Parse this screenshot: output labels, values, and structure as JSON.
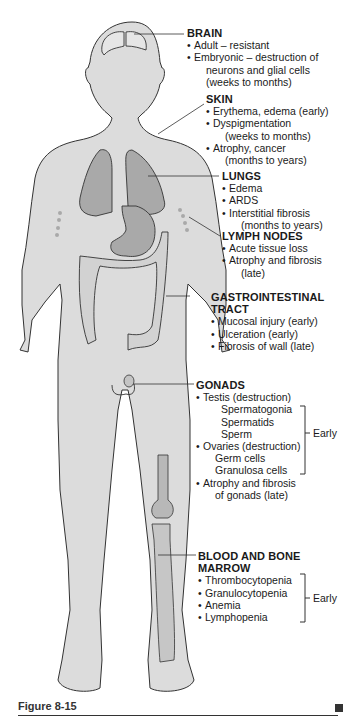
{
  "figure": {
    "caption": "Figure 8-15",
    "colors": {
      "body_fill": "#dcdcdc",
      "organ_fill": "#a9a9a9",
      "outline": "#333333",
      "text": "#1a1a1a"
    }
  },
  "labels": {
    "brain": {
      "title": "BRAIN",
      "items": [
        {
          "text": "Adult – resistant"
        },
        {
          "text": "Embryonic – destruction of",
          "cont": [
            "neurons and glial cells",
            "(weeks to months)"
          ]
        }
      ]
    },
    "skin": {
      "title": "SKIN",
      "items": [
        {
          "text": "Erythema, edema (early)"
        },
        {
          "text": "Dyspigmentation",
          "cont": [
            "(weeks to months)"
          ]
        },
        {
          "text": "Atrophy, cancer",
          "cont": [
            "(months to years)"
          ]
        }
      ]
    },
    "lungs": {
      "title": "LUNGS",
      "items": [
        {
          "text": "Edema"
        },
        {
          "text": "ARDS"
        },
        {
          "text": "Interstitial fibrosis",
          "cont": [
            "(months to years)"
          ]
        }
      ]
    },
    "lymph_nodes": {
      "title": "LYMPH NODES",
      "items": [
        {
          "text": "Acute tissue loss"
        },
        {
          "text": "Atrophy and fibrosis",
          "cont": [
            "(late)"
          ]
        }
      ]
    },
    "gi_tract": {
      "title_line1": "GASTROINTESTINAL",
      "title_line2": "TRACT",
      "items": [
        {
          "text": "Mucosal injury (early)"
        },
        {
          "text": "Ulceration (early)"
        },
        {
          "text": "Fibrosis of wall (late)"
        }
      ]
    },
    "gonads": {
      "title": "GONADS",
      "testis": "Testis (destruction)",
      "testis_sub": [
        "Spermatogonia",
        "Spermatids",
        "Sperm"
      ],
      "ovaries": "Ovaries (destruction)",
      "ovaries_sub": [
        "Germ cells",
        "Granulosa cells"
      ],
      "late": "Atrophy and fibrosis",
      "late_cont": "of gonads (late)",
      "bracket_label": "Early"
    },
    "blood_marrow": {
      "title_line1": "BLOOD AND BONE",
      "title_line2": "MARROW",
      "items": [
        "Thrombocytopenia",
        "Granulocytopenia",
        "Anemia",
        "Lymphopenia"
      ],
      "bracket_label": "Early"
    }
  }
}
